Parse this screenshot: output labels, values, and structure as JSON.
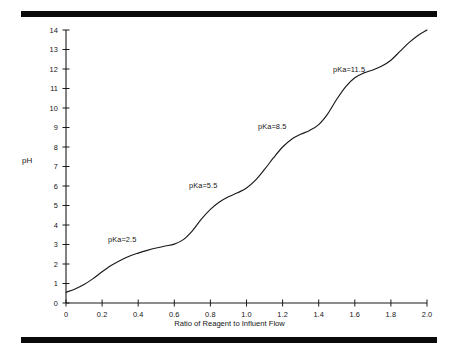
{
  "figure": {
    "top_rule": "horizontal-rule",
    "bottom_rule": "horizontal-rule"
  },
  "chart_data": {
    "type": "line",
    "title": "",
    "subtitle": "",
    "xlabel": "Ratio of Reagent to Influent Flow",
    "ylabel": "pH",
    "xlim": [
      0,
      2.0
    ],
    "ylim": [
      0,
      14
    ],
    "grid": false,
    "legend": null,
    "x_ticks": [
      0,
      0.2,
      0.4,
      0.6,
      0.8,
      1.0,
      1.2,
      1.4,
      1.6,
      1.8,
      2.0
    ],
    "x_tick_labels": [
      "0",
      "0.2",
      "0.4",
      "0.6",
      "0.8",
      "1.0",
      "1.2",
      "1.4",
      "1.6",
      "1.8",
      "2.0"
    ],
    "y_ticks": [
      0,
      1,
      2,
      3,
      4,
      5,
      6,
      7,
      8,
      9,
      10,
      11,
      12,
      13,
      14
    ],
    "y_tick_labels": [
      "0",
      "1",
      "2",
      "3",
      "4",
      "5",
      "6",
      "7",
      "8",
      "9",
      "10",
      "11",
      "12",
      "13",
      "14"
    ],
    "series": [
      {
        "name": "titration-curve",
        "color": "#1a1a1a",
        "x": [
          0.0,
          0.05,
          0.1,
          0.15,
          0.2,
          0.25,
          0.3,
          0.35,
          0.4,
          0.45,
          0.5,
          0.55,
          0.6,
          0.65,
          0.7,
          0.75,
          0.8,
          0.85,
          0.9,
          0.95,
          1.0,
          1.05,
          1.1,
          1.15,
          1.2,
          1.25,
          1.3,
          1.35,
          1.4,
          1.45,
          1.5,
          1.55,
          1.6,
          1.65,
          1.7,
          1.75,
          1.8,
          1.85,
          1.9,
          1.95,
          2.0
        ],
        "y": [
          0.55,
          0.72,
          0.95,
          1.25,
          1.6,
          1.92,
          2.18,
          2.4,
          2.56,
          2.7,
          2.82,
          2.92,
          3.02,
          3.25,
          3.7,
          4.3,
          4.8,
          5.18,
          5.45,
          5.65,
          5.9,
          6.3,
          6.85,
          7.45,
          8.0,
          8.4,
          8.65,
          8.85,
          9.15,
          9.7,
          10.45,
          11.1,
          11.55,
          11.8,
          11.95,
          12.15,
          12.45,
          12.9,
          13.35,
          13.72,
          14.0
        ]
      }
    ],
    "annotations": [
      {
        "label": "pKa=2.5",
        "x_px": 108,
        "y_px": 235
      },
      {
        "label": "pKa=5.5",
        "x_px": 189,
        "y_px": 181
      },
      {
        "label": "pKa=8.5",
        "x_px": 258,
        "y_px": 122
      },
      {
        "label": "pKa=11.5",
        "x_px": 333,
        "y_px": 65
      }
    ]
  }
}
